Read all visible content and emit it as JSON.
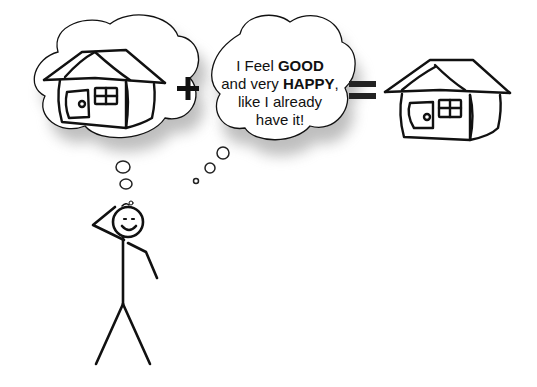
{
  "diagram": {
    "operators": {
      "plus": "+",
      "equals": "="
    },
    "thought_bubble_left": {
      "content": "house-icon"
    },
    "thought_bubble_right": {
      "line1_prefix": "I Feel ",
      "line1_bold": "GOOD",
      "line2_prefix": "and very ",
      "line2_bold": "HAPPY",
      "line2_suffix": ",",
      "line3": "like I already",
      "line4": "have it!"
    },
    "result": {
      "content": "house-icon"
    },
    "figure": {
      "content": "stick-figure-thinking",
      "expression": "smiling"
    },
    "colors": {
      "ink": "#111111",
      "background": "#ffffff",
      "shadow": "#9a9a9a"
    }
  }
}
